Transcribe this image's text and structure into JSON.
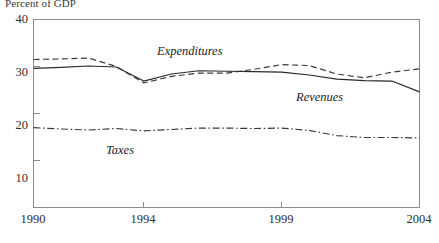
{
  "chart_data": {
    "type": "line",
    "title": "",
    "ylabel": "Percent of GDP",
    "xlabel": "",
    "ylim": [
      0,
      40
    ],
    "xlim": [
      1990,
      2004
    ],
    "grid": false,
    "legend_position": "inline-labels",
    "ytick_labels": [
      "40",
      "30",
      "20",
      "10"
    ],
    "ytick_values": [
      40,
      30,
      20,
      10
    ],
    "xtick_labels": [
      "1990",
      "1994",
      "1999",
      "2004"
    ],
    "xtick_values": [
      1990,
      1994,
      1999,
      2004
    ],
    "x": [
      1990,
      1991,
      1992,
      1993,
      1994,
      1995,
      1996,
      1997,
      1998,
      1999,
      2000,
      2001,
      2002,
      2003,
      2004
    ],
    "series": [
      {
        "name": "Expenditures",
        "style": "dashed",
        "color": "#3a3a3a",
        "values": [
          31.5,
          31.6,
          31.8,
          30.0,
          26.5,
          27.9,
          28.6,
          28.6,
          29.4,
          30.4,
          30.2,
          28.4,
          27.6,
          28.8,
          29.5
        ],
        "label_x": 1996.1,
        "label_y": 33.9
      },
      {
        "name": "Revenues",
        "style": "solid",
        "color": "#2a2a2a",
        "values": [
          29.6,
          29.8,
          30.1,
          29.9,
          26.9,
          28.4,
          29.1,
          29.0,
          28.9,
          28.8,
          28.2,
          27.3,
          27.0,
          26.9,
          24.6
        ],
        "label_x": 1999.2,
        "label_y": 25.2
      },
      {
        "name": "Taxes",
        "style": "dash-dot",
        "color": "#3a3a3a",
        "values": [
          17.0,
          16.7,
          16.5,
          16.8,
          16.3,
          16.6,
          16.9,
          16.9,
          16.8,
          16.9,
          16.4,
          15.3,
          14.9,
          14.9,
          14.8
        ],
        "label_x": 1993.1,
        "label_y": 13.6
      }
    ]
  },
  "labels": {
    "axis_title": "Percent of GDP",
    "ytick_0": "40",
    "ytick_1": "30",
    "ytick_2": "20",
    "ytick_3": "10",
    "xtick_0": "1990",
    "xtick_1": "1994",
    "xtick_2": "1999",
    "xtick_3": "2004",
    "series_expenditures": "Expenditures",
    "series_revenues": "Revenues",
    "series_taxes": "Taxes"
  }
}
